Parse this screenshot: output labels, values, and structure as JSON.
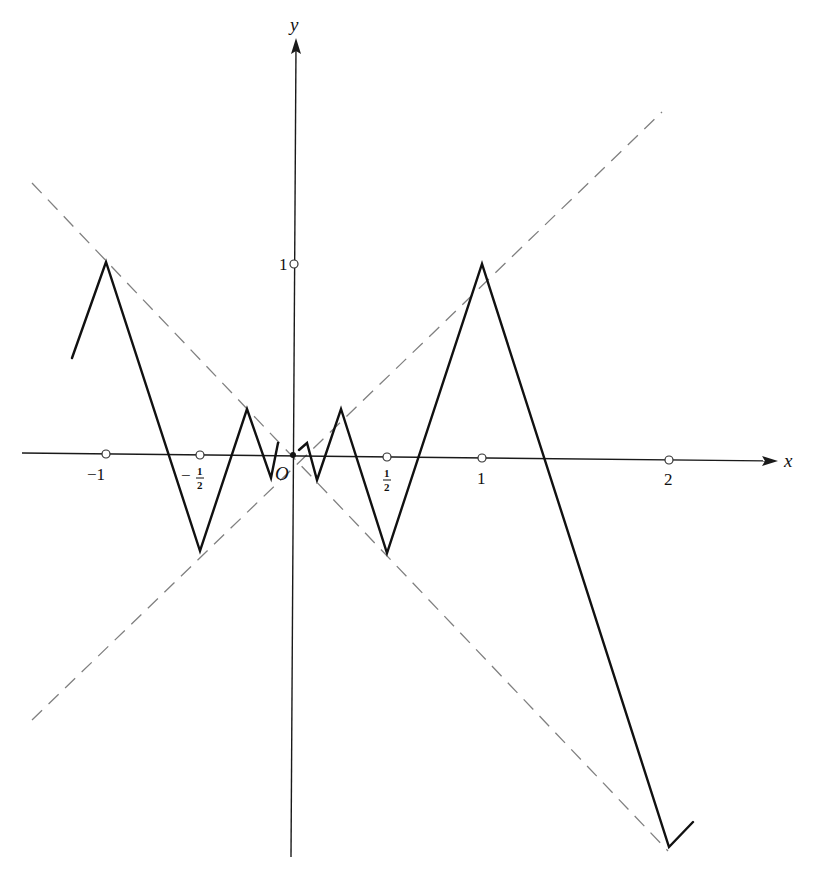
{
  "figure": {
    "type": "function graph",
    "axes": {
      "x_label": "x",
      "y_label": "y",
      "origin_label": "O"
    },
    "x_ticks": [
      {
        "label": "−1",
        "value": -1
      },
      {
        "label_num": "1",
        "label_den": "2",
        "sign": "−",
        "value": -0.5
      },
      {
        "label_num": "1",
        "label_den": "2",
        "sign": "",
        "value": 0.5
      },
      {
        "label": "1",
        "value": 1
      },
      {
        "label": "2",
        "value": 2
      }
    ],
    "y_ticks": [
      {
        "label": "1",
        "value": 1
      }
    ],
    "asymptote_lines": [
      {
        "name": "y = x",
        "style": "dashed",
        "color": "#808080"
      },
      {
        "name": "y = -x",
        "style": "dashed",
        "color": "#808080"
      }
    ],
    "curve_vertices": [
      {
        "x": -1.17,
        "y": 0.5
      },
      {
        "x": -1,
        "y": 1
      },
      {
        "x": -0.5,
        "y": -0.5
      },
      {
        "x": -0.25,
        "y": 0.25
      },
      {
        "x": -0.125,
        "y": -0.125
      },
      {
        "x": -0.08,
        "y": 0.06
      },
      {
        "x": 0.03,
        "y": 0.03
      },
      {
        "x": 0.07,
        "y": 0.06
      },
      {
        "x": 0.125,
        "y": -0.125
      },
      {
        "x": 0.25,
        "y": 0.25
      },
      {
        "x": 0.5,
        "y": -0.5
      },
      {
        "x": 1,
        "y": 1
      },
      {
        "x": 2,
        "y": -2
      },
      {
        "x": 2.13,
        "y": -1.87
      }
    ],
    "colors": {
      "curve": "#111111",
      "axes": "#1a1a1a",
      "asymptotes": "#808080",
      "background": "#ffffff"
    }
  }
}
